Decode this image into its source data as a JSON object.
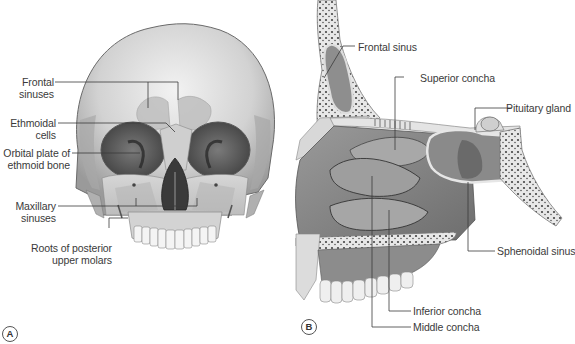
{
  "figure": {
    "panels": [
      {
        "id": "A",
        "marker": "A",
        "view": "anterior view of skull",
        "labels": [
          {
            "key": "frontal_sinuses",
            "line1": "Frontal",
            "line2": "sinuses"
          },
          {
            "key": "ethmoidal_cells",
            "line1": "Ethmoidal",
            "line2": "cells"
          },
          {
            "key": "orbital_plate",
            "line1": "Orbital plate of",
            "line2": "ethmoid bone"
          },
          {
            "key": "maxillary_sinuses",
            "line1": "Maxillary",
            "line2": "sinuses"
          },
          {
            "key": "roots_molars",
            "line1": "Roots of posterior",
            "line2": "upper molars"
          }
        ]
      },
      {
        "id": "B",
        "marker": "B",
        "view": "sagittal section of nasal cavity",
        "labels": [
          {
            "key": "frontal_sinus",
            "text": "Frontal sinus"
          },
          {
            "key": "superior_concha",
            "text": "Superior concha"
          },
          {
            "key": "pituitary_gland",
            "text": "Pituitary gland"
          },
          {
            "key": "sphenoidal_sinus",
            "text": "Sphenoidal sinus"
          },
          {
            "key": "inferior_concha",
            "text": "Inferior concha"
          },
          {
            "key": "middle_concha",
            "text": "Middle concha"
          }
        ]
      }
    ],
    "colors": {
      "bone": "#d9d9d9",
      "bone_shadow": "#8a8a8a",
      "sinus_highlight": "#c8c8c8",
      "cavity": "#5e5e5e",
      "leader_line": "#3a3a3a",
      "label_text": "#3a3a3a"
    }
  }
}
